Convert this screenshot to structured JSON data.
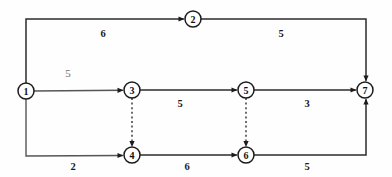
{
  "diagram": {
    "kind": "activity-on-arrow-network",
    "background_color": "#fefefe",
    "line_color": "#2b2b2b",
    "node_fill": "#ffffff",
    "node_stroke": "#1c1c1c",
    "faint_label_color": "#6e6e6e",
    "nodes": [
      {
        "id": "1",
        "label": "1",
        "cx": 26,
        "cy": 91,
        "r": 8
      },
      {
        "id": "2",
        "label": "2",
        "cx": 193,
        "cy": 19,
        "r": 8
      },
      {
        "id": "3",
        "label": "3",
        "cx": 132,
        "cy": 90,
        "r": 8
      },
      {
        "id": "4",
        "label": "4",
        "cx": 132,
        "cy": 155,
        "r": 8
      },
      {
        "id": "5",
        "label": "5",
        "cx": 246,
        "cy": 90,
        "r": 8
      },
      {
        "id": "6",
        "label": "6",
        "cx": 246,
        "cy": 155,
        "r": 8
      },
      {
        "id": "7",
        "label": "7",
        "cx": 365,
        "cy": 90,
        "r": 8
      }
    ],
    "edges": [
      {
        "id": "e12",
        "from": "1",
        "to": "2",
        "weight": "6",
        "style": "solid",
        "label_x": 103,
        "label_y": 33,
        "label_style": "bold"
      },
      {
        "id": "e27",
        "from": "2",
        "to": "7",
        "weight": "5",
        "style": "solid",
        "label_x": 281,
        "label_y": 33,
        "label_style": "bold"
      },
      {
        "id": "e13",
        "from": "1",
        "to": "3",
        "weight": "5",
        "style": "solid",
        "label_x": 68,
        "label_y": 73,
        "label_style": "light"
      },
      {
        "id": "e35",
        "from": "3",
        "to": "5",
        "weight": "5",
        "style": "solid",
        "label_x": 180,
        "label_y": 103,
        "label_style": "bold"
      },
      {
        "id": "e57",
        "from": "5",
        "to": "7",
        "weight": "3",
        "style": "solid",
        "label_x": 307,
        "label_y": 103,
        "label_style": "bold"
      },
      {
        "id": "e14",
        "from": "1",
        "to": "4",
        "weight": "2",
        "style": "solid",
        "label_x": 73,
        "label_y": 166,
        "label_style": "bold"
      },
      {
        "id": "e46",
        "from": "4",
        "to": "6",
        "weight": "6",
        "style": "solid",
        "label_x": 187,
        "label_y": 166,
        "label_style": "bold"
      },
      {
        "id": "e67",
        "from": "6",
        "to": "7",
        "weight": "5",
        "style": "solid",
        "label_x": 307,
        "label_y": 166,
        "label_style": "bold"
      },
      {
        "id": "e34",
        "from": "3",
        "to": "4",
        "weight": "",
        "style": "dashed",
        "label_x": 0,
        "label_y": 0,
        "label_style": "none"
      },
      {
        "id": "e56",
        "from": "5",
        "to": "6",
        "weight": "",
        "style": "dashed",
        "label_x": 0,
        "label_y": 0,
        "label_style": "none"
      }
    ],
    "weights": {
      "top_left": "6",
      "top_right": "5",
      "mid_left": "5",
      "mid_center": "5",
      "mid_right": "3",
      "bottom_left": "2",
      "bottom_center": "6",
      "bottom_right": "5"
    }
  }
}
